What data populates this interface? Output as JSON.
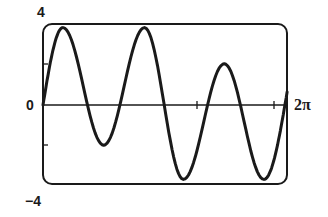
{
  "chart_data": {
    "type": "line",
    "title": "",
    "xlabel": "",
    "ylabel": "",
    "xlim": [
      0,
      6.6
    ],
    "ylim": [
      -4,
      4
    ],
    "grid": false,
    "legend": null,
    "axis_labels": {
      "y_top": "4",
      "y_bottom": "−4",
      "origin": "0",
      "x_right": "2π"
    },
    "x_ticks_px": [
      197,
      274
    ],
    "y_ticks_px": [
      64,
      145
    ],
    "series": [
      {
        "name": "curve",
        "color": "#1a1a1a",
        "extrema": [
          {
            "x": 0.0,
            "y": 0.0
          },
          {
            "x": 0.54,
            "y": 3.85
          },
          {
            "x": 1.65,
            "y": -2.0
          },
          {
            "x": 2.76,
            "y": 3.85
          },
          {
            "x": 3.82,
            "y": -3.7
          },
          {
            "x": 4.93,
            "y": 2.05
          },
          {
            "x": 6.01,
            "y": -3.7
          },
          {
            "x": 6.64,
            "y": 0.65
          }
        ],
        "zero_crossings_x": [
          1.14,
          2.14,
          3.22,
          4.39,
          5.47,
          6.57
        ]
      }
    ]
  },
  "frame": {
    "left_px": 43,
    "right_px": 287,
    "top_px": 24,
    "bottom_px": 184,
    "x0_px": 43,
    "x2pi_px": 274,
    "y0_px": 105,
    "px_per_unit_y": 20.1
  }
}
